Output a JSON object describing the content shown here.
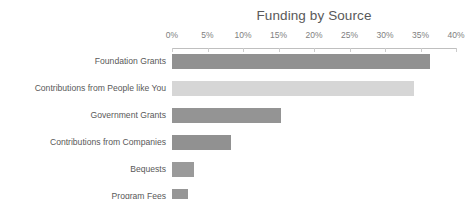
{
  "chart_data": {
    "type": "bar",
    "orientation": "horizontal",
    "title": "Funding by Source",
    "xlabel": "",
    "ylabel": "",
    "xlim": [
      0,
      40
    ],
    "xtick_labels": [
      "0%",
      "5%",
      "10%",
      "15%",
      "20%",
      "25%",
      "30%",
      "35%",
      "40%"
    ],
    "xtick_values": [
      0,
      5,
      10,
      15,
      20,
      25,
      30,
      35,
      40
    ],
    "grid": false,
    "legend": "none",
    "value_unit": "%",
    "categories": [
      "Foundation Grants",
      "Contributions from People like You",
      "Government Grants",
      "Contributions from Companies",
      "Bequests",
      "Program Fees"
    ],
    "values": [
      36.3,
      34.1,
      15.3,
      8.3,
      3.1,
      2.3
    ],
    "bar_colors": [
      "#919191",
      "#d6d6d6",
      "#949494",
      "#919191",
      "#9a9a9a",
      "#969696"
    ]
  },
  "colors": {
    "background": "#ffffff",
    "title_text": "#595959",
    "tick_text": "#808080",
    "category_text": "#595959",
    "axis_line": "#bfbfbf",
    "tick_mark": "#cccccc",
    "bar_dark": "#919191",
    "bar_light": "#d6d6d6"
  }
}
